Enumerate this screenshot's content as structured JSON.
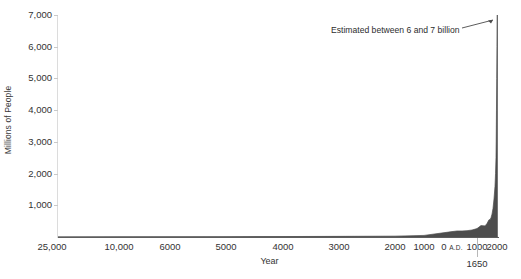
{
  "chart_data": {
    "type": "area",
    "title": "",
    "subtitle": "",
    "xlabel": "Year",
    "ylabel": "Millions of People",
    "ylim": [
      0,
      7000
    ],
    "grid": false,
    "legend_position": "none",
    "y_ticks": [
      "1,000",
      "2,000",
      "3,000",
      "4,000",
      "5,000",
      "6,000",
      "7,000"
    ],
    "y_tick_values": [
      1000,
      2000,
      3000,
      4000,
      5000,
      6000,
      7000
    ],
    "x_ticks": [
      {
        "label": "25,000",
        "suffix": ""
      },
      {
        "label": "10,000",
        "suffix": ""
      },
      {
        "label": "6000",
        "suffix": ""
      },
      {
        "label": "5000",
        "suffix": ""
      },
      {
        "label": "4000",
        "suffix": ""
      },
      {
        "label": "3000",
        "suffix": ""
      },
      {
        "label": "2000",
        "suffix": ""
      },
      {
        "label": "1000",
        "suffix": ""
      },
      {
        "label": "0 ",
        "suffix": "A.D."
      },
      {
        "label": "1000",
        "suffix": ""
      },
      {
        "label": "2000",
        "suffix": ""
      }
    ],
    "series": [
      {
        "name": "World Population",
        "x": [
          -25000,
          -10000,
          -6000,
          -5000,
          -4000,
          -3000,
          -2000,
          -1000,
          0,
          200,
          400,
          600,
          800,
          1000,
          1200,
          1400,
          1500,
          1600,
          1650,
          1700,
          1750,
          1800,
          1850,
          1900,
          1927,
          1950,
          1960,
          1974,
          1987,
          1999,
          2011,
          2020
        ],
        "values": [
          3,
          4,
          7,
          10,
          14,
          20,
          27,
          50,
          170,
          190,
          190,
          200,
          220,
          265,
          360,
          350,
          425,
          545,
          545,
          610,
          720,
          900,
          1200,
          1600,
          2000,
          2500,
          3000,
          4000,
          5000,
          6000,
          7000,
          7800
        ]
      }
    ],
    "fill_color": "#4d4d4d",
    "axis_color": "#5d5d5d"
  },
  "annotations": {
    "peak_note": "Estimated between 6 and 7 billion",
    "marker_1650": "1650"
  }
}
